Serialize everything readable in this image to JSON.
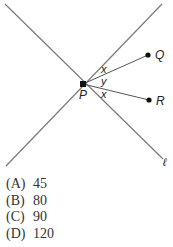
{
  "figure": {
    "point_p": "P",
    "point_q": "Q",
    "point_r": "R",
    "line_label": "ℓ",
    "angle_top": "x",
    "angle_middle": "y",
    "angle_bottom": "x",
    "colors": {
      "line": "#7a7a7a",
      "ray": "#555555",
      "dot": "#111111",
      "text": "#222222"
    }
  },
  "choices": [
    {
      "letter": "(A)",
      "value": "45"
    },
    {
      "letter": "(B)",
      "value": "80"
    },
    {
      "letter": "(C)",
      "value": "90"
    },
    {
      "letter": "(D)",
      "value": "120"
    }
  ]
}
